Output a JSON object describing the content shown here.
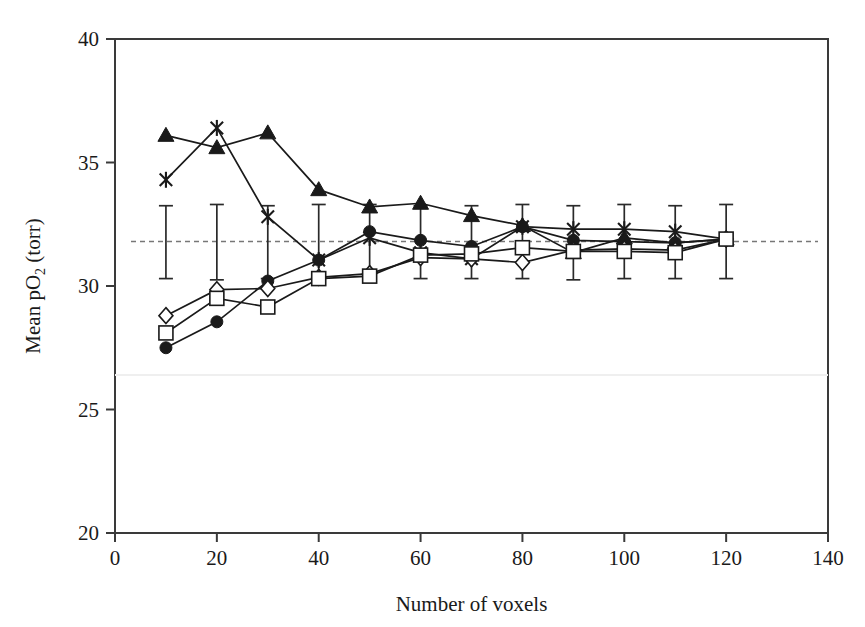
{
  "chart_data": {
    "type": "line",
    "title": "",
    "xlabel": "Number of voxels",
    "ylabel": "Mean pO2 (torr)",
    "ylabel_main": "Mean pO",
    "ylabel_sub": "2",
    "ylabel_unit": " (torr)",
    "xlim": [
      0,
      140
    ],
    "ylim": [
      20,
      40
    ],
    "xticks": [
      0,
      20,
      40,
      60,
      80,
      100,
      120,
      140
    ],
    "yticks": [
      20,
      25,
      30,
      35,
      40
    ],
    "grid": false,
    "legend": "none",
    "x": [
      10,
      20,
      30,
      40,
      50,
      60,
      70,
      80,
      90,
      100,
      110,
      120
    ],
    "reference_line": {
      "value": 31.8,
      "style": "dashed",
      "color": "#777777"
    },
    "errorbars": {
      "series": "errorbar-series",
      "x": [
        10,
        20,
        30,
        40,
        50,
        60,
        70,
        80,
        90,
        100,
        110,
        120
      ],
      "upper": [
        33.25,
        33.3,
        33.25,
        33.3,
        33.3,
        33.25,
        33.25,
        33.3,
        33.25,
        33.3,
        33.25,
        33.3
      ],
      "lower": [
        30.3,
        30.25,
        30.3,
        30.3,
        30.3,
        30.3,
        30.3,
        30.3,
        30.25,
        30.3,
        30.3,
        30.3
      ]
    },
    "series": [
      {
        "name": "filled-triangle",
        "marker": "triangle-filled",
        "color": "#1a1a1a",
        "values": [
          36.1,
          35.6,
          36.2,
          33.9,
          33.2,
          33.35,
          32.85,
          32.45,
          31.35,
          31.95,
          31.75,
          31.9
        ]
      },
      {
        "name": "cross-x",
        "marker": "asterisk",
        "color": "#1a1a1a",
        "values": [
          34.3,
          36.4,
          32.8,
          31.05,
          31.95,
          31.35,
          31.1,
          32.4,
          32.3,
          32.3,
          32.2,
          31.9
        ]
      },
      {
        "name": "filled-circle",
        "marker": "circle-filled",
        "color": "#1a1a1a",
        "values": [
          27.5,
          28.55,
          30.2,
          31.05,
          32.2,
          31.85,
          31.6,
          32.4,
          31.85,
          31.8,
          31.75,
          31.9
        ]
      },
      {
        "name": "open-diamond",
        "marker": "diamond-open",
        "color": "#1a1a1a",
        "values": [
          28.8,
          29.85,
          29.9,
          30.35,
          30.5,
          31.15,
          31.1,
          30.95,
          31.45,
          31.5,
          31.45,
          31.9
        ]
      },
      {
        "name": "open-square",
        "marker": "square-open",
        "color": "#1a1a1a",
        "values": [
          28.1,
          29.5,
          29.15,
          30.3,
          30.4,
          31.25,
          31.3,
          31.55,
          31.4,
          31.4,
          31.35,
          31.9
        ]
      }
    ]
  },
  "axes": {
    "x_tick_labels": [
      "0",
      "20",
      "40",
      "60",
      "80",
      "100",
      "120",
      "140"
    ],
    "y_tick_labels": [
      "20",
      "25",
      "30",
      "35",
      "40"
    ],
    "x_axis_title": "Number of voxels",
    "y_axis_title_part1": "Mean pO",
    "y_axis_title_sub": "2",
    "y_axis_title_part2": " (torr)"
  }
}
